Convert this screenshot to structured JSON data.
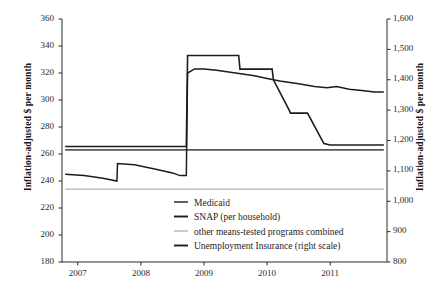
{
  "chart_data": {
    "type": "line",
    "title": "",
    "subtitle": "",
    "xlabel": "",
    "ylabel": "Inflation-adjusted $ per month",
    "ylabel_right": "Inflation-adjusted $ per month",
    "xlim": [
      2006.75,
      2011.9
    ],
    "ylim": [
      180,
      360
    ],
    "ylim_right": [
      800,
      1600
    ],
    "grid": false,
    "legend_position": "inside-bottom-center",
    "xticks": [
      "2007",
      "2008",
      "2009",
      "2010",
      "2011"
    ],
    "xtick_values": [
      2007,
      2008,
      2009,
      2010,
      2011
    ],
    "yticks_left": [
      "360",
      "340",
      "320",
      "300",
      "280",
      "260",
      "240",
      "220",
      "200",
      "180"
    ],
    "ytick_values_left": [
      360,
      340,
      320,
      300,
      280,
      260,
      240,
      220,
      200,
      180
    ],
    "yticks_right": [
      "1,600",
      "1,500",
      "1,400",
      "1,300",
      "1,200",
      "1,100",
      "1,000",
      "900",
      "800"
    ],
    "ytick_values_right": [
      1600,
      1500,
      1400,
      1300,
      1200,
      1100,
      1000,
      900,
      800
    ],
    "series": [
      {
        "name": "Medicaid",
        "label": "Medicaid",
        "axis": "left",
        "color": "#585858",
        "width": 1.7,
        "points": [
          [
            2006.8,
            263
          ],
          [
            2008.0,
            263
          ],
          [
            2009.0,
            263
          ],
          [
            2010.0,
            263
          ],
          [
            2011.0,
            263
          ],
          [
            2011.85,
            263
          ]
        ]
      },
      {
        "name": "SNAP (per household)",
        "label": "SNAP (per household)",
        "axis": "left",
        "color": "#1c1c1c",
        "width": 1.5,
        "points": [
          [
            2006.8,
            245
          ],
          [
            2007.1,
            244
          ],
          [
            2007.4,
            242
          ],
          [
            2007.62,
            240
          ],
          [
            2007.63,
            253
          ],
          [
            2007.9,
            252
          ],
          [
            2008.2,
            249
          ],
          [
            2008.5,
            246
          ],
          [
            2008.62,
            244
          ],
          [
            2008.63,
            244
          ],
          [
            2008.72,
            244
          ],
          [
            2008.74,
            320
          ],
          [
            2008.85,
            323
          ],
          [
            2009.0,
            323
          ],
          [
            2009.2,
            322
          ],
          [
            2009.5,
            320
          ],
          [
            2009.8,
            318
          ],
          [
            2010.0,
            316
          ],
          [
            2010.2,
            314
          ],
          [
            2010.5,
            312
          ],
          [
            2010.75,
            310
          ],
          [
            2010.95,
            309
          ],
          [
            2011.1,
            310
          ],
          [
            2011.3,
            308
          ],
          [
            2011.5,
            307
          ],
          [
            2011.7,
            306
          ],
          [
            2011.85,
            306
          ]
        ]
      },
      {
        "name": "other means-tested programs combined",
        "label": "other means-tested programs combined",
        "axis": "left",
        "color": "#c9c9c9",
        "width": 1.6,
        "points": [
          [
            2006.8,
            234
          ],
          [
            2008.0,
            234
          ],
          [
            2009.0,
            234
          ],
          [
            2010.0,
            234
          ],
          [
            2011.0,
            234
          ],
          [
            2011.85,
            234
          ]
        ]
      },
      {
        "name": "Unemployment Insurance (right scale)",
        "label": "Unemployment Insurance (right scale)",
        "axis": "right",
        "color": "#1c1c1c",
        "width": 1.6,
        "points": [
          [
            2006.8,
            1180
          ],
          [
            2008.0,
            1180
          ],
          [
            2008.6,
            1180
          ],
          [
            2008.72,
            1180
          ],
          [
            2008.74,
            1480
          ],
          [
            2009.0,
            1480
          ],
          [
            2009.55,
            1480
          ],
          [
            2009.57,
            1435
          ],
          [
            2009.62,
            1435
          ],
          [
            2010.0,
            1435
          ],
          [
            2010.08,
            1435
          ],
          [
            2010.1,
            1400
          ],
          [
            2010.35,
            1300
          ],
          [
            2010.37,
            1290
          ],
          [
            2010.62,
            1290
          ],
          [
            2010.64,
            1290
          ],
          [
            2010.9,
            1190
          ],
          [
            2011.0,
            1185
          ],
          [
            2011.4,
            1185
          ],
          [
            2011.85,
            1185
          ]
        ]
      }
    ],
    "legend": [
      {
        "label": "Medicaid",
        "color": "#585858",
        "width": 1.9
      },
      {
        "label": "SNAP (per household)",
        "color": "#1c1c1c",
        "width": 1.9
      },
      {
        "label": "other means-tested programs combined",
        "color": "#c9c9c9",
        "width": 1.9
      },
      {
        "label": "Unemployment Insurance (right scale)",
        "color": "#1c1c1c",
        "width": 1.9
      }
    ]
  }
}
